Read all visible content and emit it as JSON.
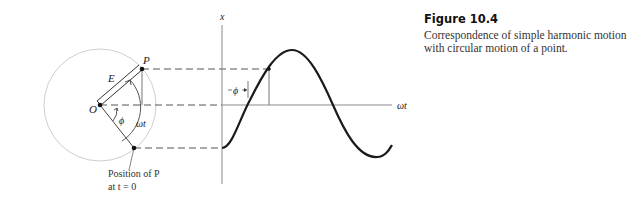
{
  "caption": {
    "title": "Figure 10.4",
    "text": "Correspondence of simple harmonic motion with circular motion of a point."
  },
  "diagram": {
    "circle_labels": {
      "point": "P",
      "origin": "O",
      "vector": "E",
      "phase": "ϕ",
      "angle": "ωt",
      "initial_line1": "Position of P",
      "initial_line2": "at t = 0"
    },
    "graph_labels": {
      "y_axis": "x",
      "x_axis": "ωt",
      "phase": "ϕ"
    },
    "colors": {
      "curve": "#1a1a1a",
      "circle": "#c8c8c8",
      "axis": "#8a8a8a",
      "dash": "#555555"
    }
  }
}
